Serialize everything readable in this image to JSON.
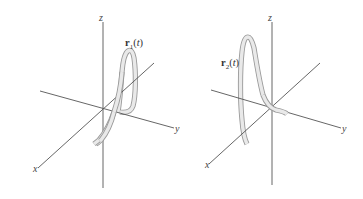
{
  "figures": [
    {
      "id": "left",
      "axes": {
        "x": "x",
        "y": "y",
        "z": "z"
      },
      "curve": {
        "name": "r",
        "subscript": "1",
        "argument": "t",
        "open": "(",
        "close": ")"
      }
    },
    {
      "id": "right",
      "axes": {
        "x": "x",
        "y": "y",
        "z": "z"
      },
      "curve": {
        "name": "r",
        "subscript": "2",
        "argument": "t",
        "open": "(",
        "close": ")"
      }
    }
  ],
  "colors": {
    "axis": "#555555",
    "tube_edge": "#9a9a9a",
    "tube_fill": "#e9e9e9",
    "label": "#444444"
  }
}
